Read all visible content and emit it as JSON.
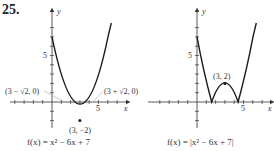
{
  "problem_number": "25.",
  "graphs": [
    {
      "id": "left",
      "caption": "f(x) = x² − 6x + 7",
      "axis_x_label": "x",
      "axis_y_label": "y",
      "x_tick_label": "5",
      "y_tick_label": "5",
      "annotations": {
        "left_root": "(3 − √2, 0)",
        "right_root": "(3 + √2, 0)",
        "vertex": "(3, −2)"
      }
    },
    {
      "id": "right",
      "caption": "f(x) = |x² − 6x + 7|",
      "axis_x_label": "x",
      "axis_y_label": "y",
      "x_tick_label": "5",
      "y_tick_label": "5",
      "annotations": {
        "vertex": "(3, 2)"
      }
    }
  ],
  "colors": {
    "curve": "#1a1a1a",
    "axis": "#333333",
    "leader": "#aaaaaa"
  }
}
